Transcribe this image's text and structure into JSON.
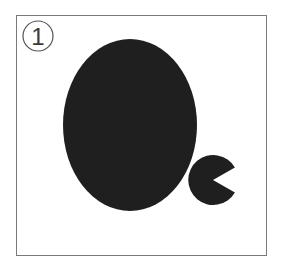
{
  "figure": {
    "label": "1",
    "label_style": "circled-digit",
    "colors": {
      "frame": "#7a7a7a",
      "shape_fill": "#1f1f1f",
      "background": "#ffffff",
      "label_stroke": "#555555"
    },
    "shapes": [
      {
        "type": "ellipse",
        "name": "large-ellipse",
        "cx": 130,
        "cy": 125,
        "rx": 67,
        "ry": 86
      },
      {
        "type": "circle-with-wedge-cut",
        "name": "small-notched-circle",
        "cx": 213,
        "cy": 180,
        "r": 25,
        "wedge_opening": "right"
      }
    ]
  }
}
